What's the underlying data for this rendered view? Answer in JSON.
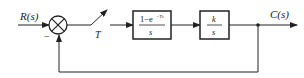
{
  "diagram": {
    "type": "block-diagram",
    "input_label": "R(s)",
    "output_label": "C(s)",
    "summing_junction": {
      "feedback_sign": "−"
    },
    "sampler": {
      "label": "T"
    },
    "block1": {
      "numerator": "1−e",
      "exponent": "−Ts",
      "denominator": "s"
    },
    "block2": {
      "numerator": "k",
      "denominator": "s"
    },
    "colors": {
      "line": "#222222",
      "background": "#ffffff"
    }
  }
}
